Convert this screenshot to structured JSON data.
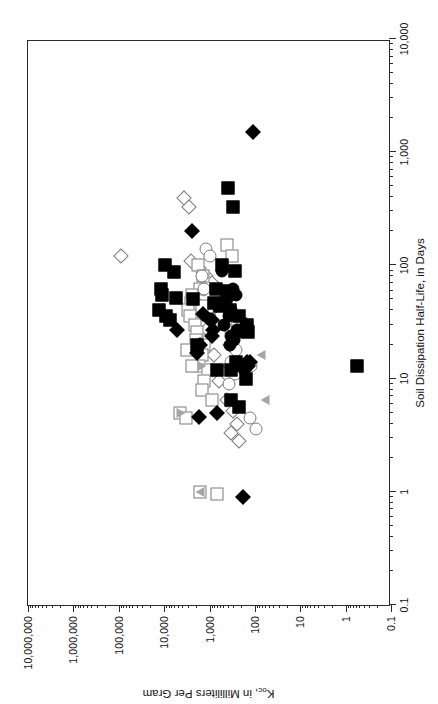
{
  "figure": {
    "orientation": "rotated-90-ccw",
    "background": "#ffffff",
    "frame_color": "#2a2a2a"
  },
  "legend": {
    "title": "EXPLANATION",
    "rows": [
      [
        {
          "label": "NPS (Det)",
          "marker": "diamond-filled"
        },
        {
          "label": "MCPS (Det)",
          "marker": "square-filled"
        },
        {
          "label": "Delmarva (Det)",
          "marker": "circle-filled"
        },
        {
          "label": "Illinois (Det)",
          "marker": "triangle-up-filled"
        },
        {
          "label": "Iowa (Det)",
          "marker": "triangle-down-filled"
        },
        {
          "label": "Minnesota (Det)",
          "marker": "triangle-down-filled"
        },
        {
          "label": "Wisconsin (Det)",
          "marker": "triangle-up-filled"
        }
      ],
      [
        {
          "label": "NPS (ND)",
          "marker": "diamond-open"
        },
        {
          "label": "MCPS (ND)",
          "marker": "square-open"
        },
        {
          "label": "Delmarva (ND)",
          "marker": "circle-open"
        },
        {
          "label": "Illinois (ND)",
          "marker": "triangle-up-open"
        },
        {
          "label": "Iowa (ND)",
          "marker": "triangle-down-open"
        },
        {
          "label": "Minnesota (ND)",
          "marker": "triangle-down-open"
        },
        {
          "label": "Wisconsin (ND)",
          "marker": "triangle-up-open"
        }
      ]
    ]
  },
  "chart_data": {
    "type": "scatter",
    "title": "",
    "xlabel": "Soil Dissipation Half-Life, in Days",
    "ylabel": "Koc, in Milliliters Per Gram",
    "ylabel_main": "K",
    "ylabel_sub": "oc",
    "ylabel_rest": ", in Milliliters Per Gram",
    "xscale": "log",
    "yscale": "log",
    "xlim": [
      0.1,
      10000
    ],
    "ylim": [
      0.1,
      10000000
    ],
    "grid": false,
    "legend_position": "top-center-inside",
    "xticks": [
      0.1,
      1,
      10,
      100,
      1000,
      10000
    ],
    "xticklabels": [
      "0.1",
      "1",
      "10",
      "100",
      "1,000",
      "10,000"
    ],
    "yticks": [
      0.1,
      1,
      10,
      100,
      1000,
      10000,
      100000,
      1000000,
      10000000
    ],
    "yticklabels": [
      "0.1",
      "1",
      "10",
      "100",
      "1,000",
      "10,000",
      "100,000",
      "1,000,000",
      "10,000,000"
    ],
    "series": [
      {
        "name": "NPS (Det)",
        "marker": "diamond-filled",
        "points": [
          [
            1500,
            110
          ],
          [
            200,
            2400
          ],
          [
            27,
            5200
          ],
          [
            20,
            1600
          ],
          [
            17,
            1900
          ],
          [
            37,
            1400
          ],
          [
            33,
            1000
          ],
          [
            33,
            870
          ],
          [
            4.6,
            1700
          ],
          [
            12,
            170
          ],
          [
            5.0,
            700
          ],
          [
            14,
            150
          ],
          [
            30,
            160
          ],
          [
            13,
            140
          ],
          [
            27,
            840
          ],
          [
            0.9,
            180
          ],
          [
            24,
            900
          ],
          [
            14,
            130
          ]
        ]
      },
      {
        "name": "NPS (ND)",
        "marker": "diamond-open",
        "points": [
          [
            390,
            3700
          ],
          [
            330,
            2900
          ],
          [
            120,
            90000
          ],
          [
            110,
            2500
          ],
          [
            95,
            1700
          ],
          [
            80,
            1200
          ],
          [
            70,
            900
          ],
          [
            62,
            1300
          ],
          [
            47,
            2200
          ],
          [
            44,
            1600
          ],
          [
            40,
            900
          ],
          [
            36,
            560
          ],
          [
            33,
            1500
          ],
          [
            30,
            700
          ],
          [
            22,
            1300
          ],
          [
            16,
            800
          ],
          [
            9.5,
            620
          ],
          [
            6.5,
            420
          ],
          [
            5.2,
            300
          ],
          [
            3.3,
            330
          ],
          [
            4.0,
            250
          ],
          [
            2.8,
            220
          ],
          [
            13,
            360
          ],
          [
            20,
            350
          ]
        ]
      },
      {
        "name": "MCPS (Det)",
        "marker": "square-filled",
        "points": [
          [
            480,
            400
          ],
          [
            330,
            300
          ],
          [
            100,
            9500
          ],
          [
            88,
            6200
          ],
          [
            62,
            12000
          ],
          [
            55,
            11000
          ],
          [
            52,
            5600
          ],
          [
            50,
            2300
          ],
          [
            40,
            13000
          ],
          [
            36,
            9000
          ],
          [
            33,
            7500
          ],
          [
            100,
            530
          ],
          [
            90,
            270
          ],
          [
            62,
            730
          ],
          [
            47,
            800
          ],
          [
            44,
            600
          ],
          [
            40,
            350
          ],
          [
            36,
            220
          ],
          [
            30,
            150
          ],
          [
            26,
            140
          ],
          [
            20,
            1900
          ],
          [
            14,
            260
          ],
          [
            13,
            0.55
          ],
          [
            12,
            330
          ],
          [
            10,
            160
          ],
          [
            6.5,
            330
          ],
          [
            5.6,
            220
          ],
          [
            12,
            700
          ],
          [
            60,
            420
          ],
          [
            58,
            360
          ]
        ]
      },
      {
        "name": "MCPS (ND)",
        "marker": "square-open",
        "points": [
          [
            150,
            420
          ],
          [
            120,
            320
          ],
          [
            100,
            1800
          ],
          [
            80,
            1400
          ],
          [
            62,
            1600
          ],
          [
            55,
            2400
          ],
          [
            47,
            2600
          ],
          [
            44,
            1500
          ],
          [
            40,
            3000
          ],
          [
            36,
            2700
          ],
          [
            30,
            2100
          ],
          [
            26,
            1900
          ],
          [
            22,
            2000
          ],
          [
            20,
            1300
          ],
          [
            16,
            1500
          ],
          [
            13,
            1700
          ],
          [
            12,
            1100
          ],
          [
            9.5,
            1300
          ],
          [
            8.0,
            1500
          ],
          [
            6.5,
            900
          ],
          [
            5.0,
            4500
          ],
          [
            4.5,
            3300
          ],
          [
            1.0,
            1600
          ],
          [
            0.95,
            700
          ],
          [
            13,
            2400
          ],
          [
            18,
            3200
          ],
          [
            30,
            340
          ],
          [
            44,
            430
          ]
        ]
      },
      {
        "name": "Delmarva (Det)",
        "marker": "circle-filled",
        "points": [
          [
            90,
            520
          ],
          [
            62,
            310
          ],
          [
            55,
            260
          ],
          [
            50,
            410
          ],
          [
            47,
            620
          ],
          [
            40,
            330
          ],
          [
            36,
            380
          ],
          [
            30,
            480
          ],
          [
            27,
            250
          ],
          [
            24,
            330
          ],
          [
            22,
            290
          ],
          [
            20,
            360
          ],
          [
            26,
            200
          ]
        ]
      },
      {
        "name": "Delmarva (ND)",
        "marker": "circle-open",
        "points": [
          [
            140,
            1200
          ],
          [
            120,
            1000
          ],
          [
            80,
            1500
          ],
          [
            62,
            1300
          ],
          [
            47,
            760
          ],
          [
            40,
            620
          ],
          [
            36,
            560
          ],
          [
            30,
            430
          ],
          [
            26,
            330
          ],
          [
            22,
            300
          ],
          [
            18,
            260
          ],
          [
            14,
            330
          ],
          [
            11,
            280
          ],
          [
            9.0,
            370
          ],
          [
            13,
            120
          ],
          [
            4.5,
            130
          ],
          [
            3.6,
            95
          ]
        ]
      },
      {
        "name": "Illinois (Det)",
        "marker": "triangle-up-filled",
        "points": [
          [
            36,
            330
          ]
        ]
      },
      {
        "name": "Illinois (ND)",
        "marker": "triangle-up-open",
        "points": [
          [
            16,
            75
          ],
          [
            6.5,
            60
          ],
          [
            1.0,
            1600
          ]
        ]
      },
      {
        "name": "Iowa (Det)",
        "marker": "triangle-down-filled",
        "points": [
          [
            26,
            130
          ]
        ]
      },
      {
        "name": "Iowa (ND)",
        "marker": "triangle-down-open",
        "points": [
          [
            13,
            1500
          ],
          [
            5.0,
            4300
          ]
        ]
      },
      {
        "name": "Minnesota (Det)",
        "marker": "triangle-down-filled",
        "points": []
      },
      {
        "name": "Minnesota (ND)",
        "marker": "triangle-down-open",
        "points": []
      },
      {
        "name": "Wisconsin (Det)",
        "marker": "triangle-up-filled",
        "points": []
      },
      {
        "name": "Wisconsin (ND)",
        "marker": "triangle-up-open",
        "points": []
      }
    ]
  }
}
